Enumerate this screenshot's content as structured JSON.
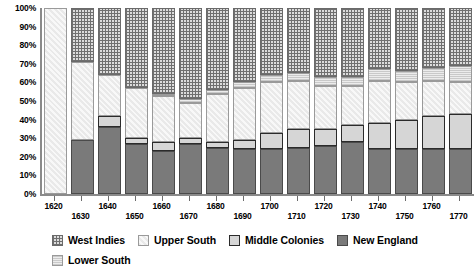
{
  "chart_data": {
    "type": "bar",
    "subtype": "stacked-percentage",
    "title": "",
    "xlabel": "",
    "ylabel": "",
    "ylim": [
      0,
      100
    ],
    "y_tick_labels": [
      "0%",
      "10%",
      "20%",
      "30%",
      "40%",
      "50%",
      "60%",
      "70%",
      "80%",
      "90%",
      "100%"
    ],
    "y_tick_values": [
      0,
      10,
      20,
      30,
      40,
      50,
      60,
      70,
      80,
      90,
      100
    ],
    "grid": false,
    "legend_position": "bottom",
    "categories": [
      "1620",
      "1630",
      "1640",
      "1650",
      "1660",
      "1670",
      "1680",
      "1690",
      "1700",
      "1710",
      "1720",
      "1730",
      "1740",
      "1750",
      "1760",
      "1770"
    ],
    "stack_order_bottom_to_top": [
      "New England",
      "Middle Colonies",
      "Upper South",
      "Lower South",
      "West Indies"
    ],
    "series": [
      {
        "name": "New England",
        "color": "#7a7a7a",
        "pattern": "solid",
        "values": [
          0,
          29,
          36,
          27,
          23,
          27,
          25,
          24,
          24,
          25,
          26,
          28,
          24,
          24,
          24,
          24
        ]
      },
      {
        "name": "Middle Colonies",
        "color": "#d6d6d6",
        "pattern": "solid-outlined",
        "values": [
          0,
          0,
          6,
          3,
          5,
          3,
          3,
          5,
          9,
          10,
          9,
          9,
          14,
          16,
          18,
          19
        ]
      },
      {
        "name": "Upper South",
        "color": "#eeeeee",
        "pattern": "diagonal-hatch",
        "values": [
          100,
          42,
          22,
          27,
          25,
          19,
          26,
          28,
          27,
          26,
          23,
          21,
          23,
          20,
          19,
          17
        ]
      },
      {
        "name": "Lower South",
        "color": "#dddddd",
        "pattern": "dotted",
        "values": [
          0,
          0,
          0,
          0,
          1,
          2,
          2,
          3,
          4,
          4,
          5,
          5,
          6,
          6,
          7,
          9
        ]
      },
      {
        "name": "West Indies",
        "color": "#dcdcdc",
        "pattern": "crosshatch-grid",
        "values": [
          0,
          29,
          36,
          43,
          46,
          49,
          44,
          40,
          36,
          35,
          37,
          37,
          33,
          34,
          32,
          31
        ]
      }
    ]
  },
  "legend": {
    "items": [
      {
        "label": "West Indies",
        "swatch": "crosshatch-grid-swatch"
      },
      {
        "label": "Upper South",
        "swatch": "diagonal-hatch-swatch"
      },
      {
        "label": "Middle Colonies",
        "swatch": "solid-outlined-swatch"
      },
      {
        "label": "New England",
        "swatch": "solid-dark-swatch"
      },
      {
        "label": "Lower South",
        "swatch": "dotted-swatch"
      }
    ]
  }
}
